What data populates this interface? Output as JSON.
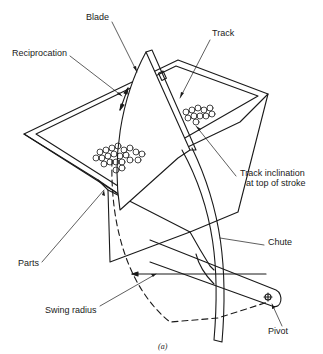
{
  "figure": {
    "labels": {
      "blade": "Blade",
      "track": "Track",
      "reciprocation": "Reciprocation",
      "track_inclination_line1": "Track inclination",
      "track_inclination_line2": "at top of stroke",
      "parts": "Parts",
      "chute": "Chute",
      "swing_radius": "Swing radius",
      "pivot": "Pivot"
    },
    "caption": "(a)",
    "colors": {
      "ink": "#1a1a1a",
      "background": "#ffffff"
    }
  }
}
